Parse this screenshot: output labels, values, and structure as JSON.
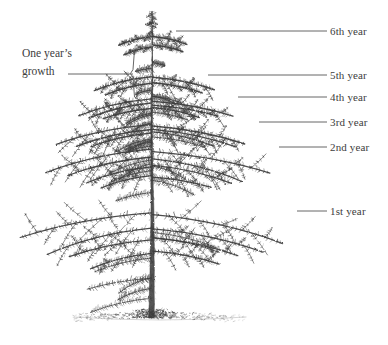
{
  "figure": {
    "background_color": "#ffffff",
    "ink_color": "#3d3d3d",
    "line_color": "#555555"
  },
  "annotations": {
    "one_year_growth": {
      "line1": "One year’s",
      "line2": "growth",
      "x": 22,
      "y": 45,
      "leader": {
        "x1": 68,
        "y1": 74,
        "x2": 133,
        "y2": 74
      },
      "bracket": {
        "x": 133,
        "y_top": 46,
        "y_bottom": 101,
        "tip_x": 141
      }
    }
  },
  "year_labels": [
    {
      "id": "year-6",
      "text": "6th year",
      "label_x": 330,
      "label_y": 26,
      "leader": {
        "x1": 176,
        "y1": 31,
        "x2": 327,
        "y2": 31
      }
    },
    {
      "id": "year-5",
      "text": "5th year",
      "label_x": 330,
      "label_y": 70,
      "leader": {
        "x1": 208,
        "y1": 75,
        "x2": 327,
        "y2": 75
      }
    },
    {
      "id": "year-4",
      "text": "4th year",
      "label_x": 330,
      "label_y": 92,
      "leader": {
        "x1": 238,
        "y1": 97,
        "x2": 327,
        "y2": 97
      }
    },
    {
      "id": "year-3",
      "text": "3rd year",
      "label_x": 330,
      "label_y": 117,
      "leader": {
        "x1": 259,
        "y1": 122,
        "x2": 327,
        "y2": 122
      }
    },
    {
      "id": "year-2",
      "text": "2nd year",
      "label_x": 330,
      "label_y": 142,
      "leader": {
        "x1": 279,
        "y1": 147,
        "x2": 327,
        "y2": 147
      }
    },
    {
      "id": "year-1",
      "text": "1st year",
      "label_x": 330,
      "label_y": 206,
      "leader": {
        "x1": 297,
        "y1": 211,
        "x2": 327,
        "y2": 211
      }
    }
  ],
  "tree": {
    "apex_x": 152,
    "apex_y": 11,
    "trunk_base_y": 318,
    "ground": {
      "x_left": 74,
      "x_right": 246,
      "y": 318
    },
    "whorls": [
      {
        "year": 6,
        "y": 36,
        "left_reach": 118,
        "right_reach": 190,
        "droop": 9
      },
      {
        "year": 5,
        "y": 78,
        "left_reach": 96,
        "right_reach": 212,
        "droop": 13
      },
      {
        "year": 4,
        "y": 100,
        "left_reach": 78,
        "right_reach": 232,
        "droop": 16
      },
      {
        "year": 3,
        "y": 125,
        "left_reach": 58,
        "right_reach": 254,
        "droop": 20
      },
      {
        "year": 2,
        "y": 150,
        "left_reach": 42,
        "right_reach": 272,
        "droop": 24
      },
      {
        "year": 1,
        "y": 214,
        "left_reach": 22,
        "right_reach": 292,
        "droop": 30
      }
    ]
  }
}
